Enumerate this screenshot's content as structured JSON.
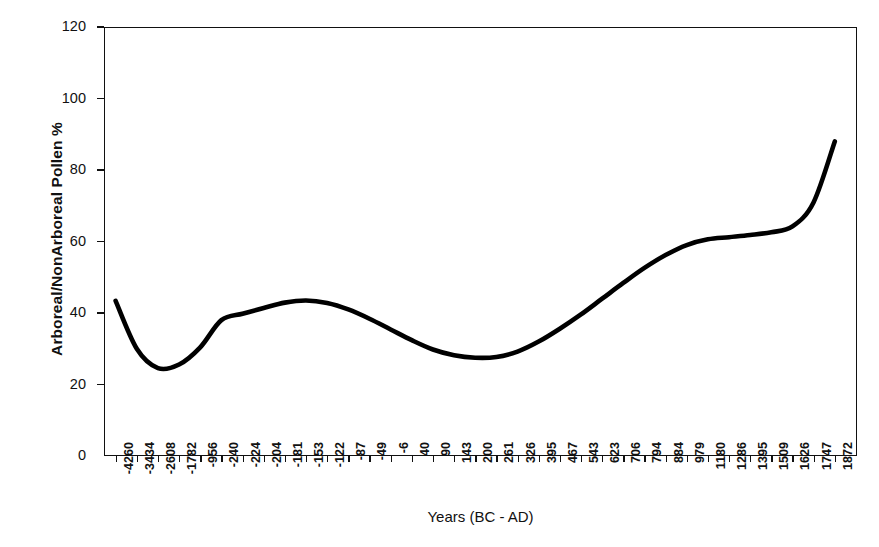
{
  "chart_data": {
    "type": "line",
    "title": "",
    "xlabel": "Years (BC - AD)",
    "ylabel": "Arboreal/NonArboreal Pollen %",
    "ylim": [
      0,
      120
    ],
    "y_ticks": [
      0,
      20,
      40,
      60,
      80,
      100,
      120
    ],
    "grid": false,
    "legend": null,
    "line_color": "#000000",
    "line_width_px": 4.5,
    "categories": [
      "-4260",
      "-3434",
      "-2608",
      "-1782",
      "-956",
      "-240",
      "-224",
      "-204",
      "-181",
      "-153",
      "-122",
      "-87",
      "-49",
      "-6",
      "40",
      "90",
      "143",
      "200",
      "261",
      "326",
      "395",
      "467",
      "543",
      "623",
      "706",
      "794",
      "884",
      "979",
      "1180",
      "1286",
      "1395",
      "1509",
      "1626",
      "1747",
      "1872"
    ],
    "series": [
      {
        "name": "Arboreal/NonArboreal Pollen %",
        "values": [
          43.4,
          30.0,
          24.6,
          25.6,
          30.4,
          38.0,
          39.8,
          41.4,
          42.9,
          43.5,
          42.8,
          41.0,
          38.4,
          35.4,
          32.4,
          29.8,
          28.2,
          27.5,
          27.7,
          29.2,
          32.0,
          35.6,
          39.6,
          44.0,
          48.4,
          52.6,
          56.2,
          59.0,
          60.6,
          61.2,
          61.8,
          62.6,
          64.2,
          71.0,
          88.0
        ]
      }
    ]
  },
  "axes": {
    "y_title": "Arboreal/NonArboreal Pollen %",
    "x_title": "Years (BC - AD)",
    "y_tick_labels": [
      "120",
      "100",
      "80",
      "60",
      "40",
      "20",
      "0"
    ],
    "x_tick_labels": [
      "-4260",
      "-3434",
      "-2608",
      "-1782",
      "-956",
      "-240",
      "-224",
      "-204",
      "-181",
      "-153",
      "-122",
      "-87",
      "-49",
      "-6",
      "40",
      "90",
      "143",
      "200",
      "261",
      "326",
      "395",
      "467",
      "543",
      "623",
      "706",
      "794",
      "884",
      "979",
      "1180",
      "1286",
      "1395",
      "1509",
      "1626",
      "1747",
      "1872"
    ]
  },
  "style": {
    "background": "#ffffff",
    "axis_color": "#111111",
    "line_color": "#000000"
  }
}
